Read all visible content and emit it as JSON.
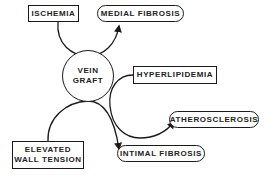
{
  "diagram": {
    "center": {
      "label_line1": "VEIN",
      "label_line2": "GRAFT"
    },
    "causes": [
      {
        "id": "ischemia",
        "label": "ISCHEMIA"
      },
      {
        "id": "hyperlipidemia",
        "label": "HYPERLIPIDEMIA"
      },
      {
        "id": "elevated-wall-tension",
        "label_line1": "ELEVATED",
        "label_line2": "WALL TENSION"
      }
    ],
    "outcomes": [
      {
        "id": "medial-fibrosis",
        "label": "MEDIAL FIBROSIS"
      },
      {
        "id": "atherosclerosis",
        "label": "ATHEROSCLEROSIS"
      },
      {
        "id": "intimal-fibrosis",
        "label": "INTIMAL FIBROSIS"
      }
    ],
    "edges": [
      {
        "from": "ischemia",
        "via": "vein-graft",
        "to": "medial-fibrosis"
      },
      {
        "from": "hyperlipidemia",
        "via": "vein-graft",
        "to": "atherosclerosis"
      },
      {
        "from": "elevated-wall-tension",
        "via": "vein-graft",
        "to": "intimal-fibrosis"
      }
    ],
    "colors": {
      "line": "#1a1a1a",
      "background": "#ffffff",
      "text": "#222222"
    }
  }
}
